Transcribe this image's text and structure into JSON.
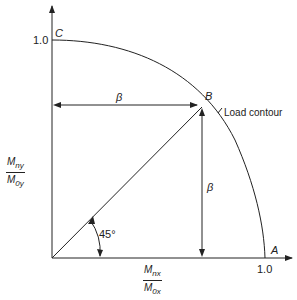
{
  "diagram": {
    "title": "Load contour",
    "points": {
      "C": {
        "label": "C",
        "value": "1.0"
      },
      "A": {
        "label": "A",
        "value": "1.0"
      },
      "B": {
        "label": "B"
      }
    },
    "contour_label": "Load contour",
    "beta_horizontal": "β",
    "beta_vertical": "β",
    "angle_label": "45°",
    "y_axis": {
      "numerator": "M",
      "num_sub": "ny",
      "denominator": "M",
      "den_sub": "0y"
    },
    "x_axis": {
      "numerator": "M",
      "num_sub": "nx",
      "denominator": "M",
      "den_sub": "0x"
    },
    "y_tick": "1.0",
    "x_tick": "1.0"
  }
}
